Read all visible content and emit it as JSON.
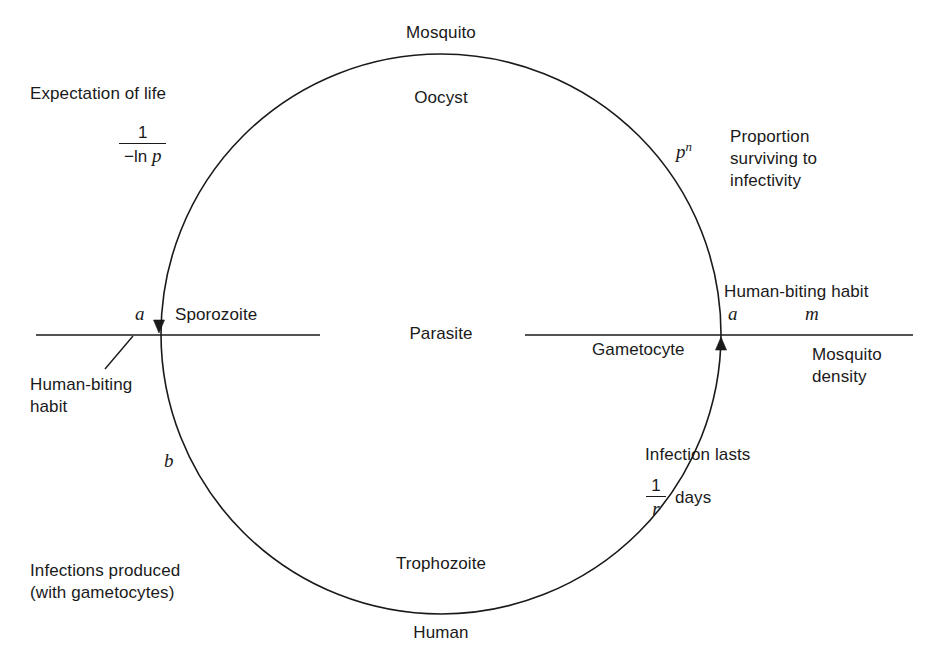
{
  "figure": {
    "type": "cycle-diagram",
    "background_color": "#ffffff",
    "stroke_color": "#1a1a1a"
  },
  "cycle_stages": {
    "top": "Mosquito",
    "top_inner": "Oocyst",
    "center": "Parasite",
    "bottom_inner": "Trophozoite",
    "bottom": "Human",
    "left_arrow_stage": "Sporozoite",
    "right_arrow_stage": "Gametocyte"
  },
  "annotations": {
    "expectation_of_life": {
      "title": "Expectation of life",
      "formula_numerator": "1",
      "formula_denominator_prefix": "−ln ",
      "formula_denominator_symbol": "p"
    },
    "survival": {
      "symbol_base": "p",
      "symbol_exponent": "n",
      "line1": "Proportion",
      "line2": "surviving to",
      "line3": "infectivity"
    },
    "human_biting_habit_right": {
      "title": "Human-biting habit",
      "symbol_a": "a",
      "symbol_m": "m"
    },
    "mosquito_density": {
      "line1": "Mosquito",
      "line2": "density"
    },
    "infection_duration": {
      "title": "Infection lasts",
      "formula_numerator": "1",
      "formula_denominator": "r",
      "unit": "days"
    },
    "human_biting_habit_left": {
      "line1": "Human-biting",
      "line2": "habit",
      "symbol_a": "a"
    },
    "infectivity_b": {
      "symbol_b": "b",
      "line1": "Infections produced",
      "line2": "(with gametocytes)"
    }
  },
  "geometry": {
    "circle_center_x": 441,
    "circle_center_y": 334,
    "circle_radius": 280,
    "axis_y": 335,
    "left_line_start_x": 36,
    "left_line_end_x": 320,
    "right_line_start_x": 525,
    "right_line_end_x": 913,
    "left_arrow_x": 159,
    "right_arrow_x": 721
  }
}
